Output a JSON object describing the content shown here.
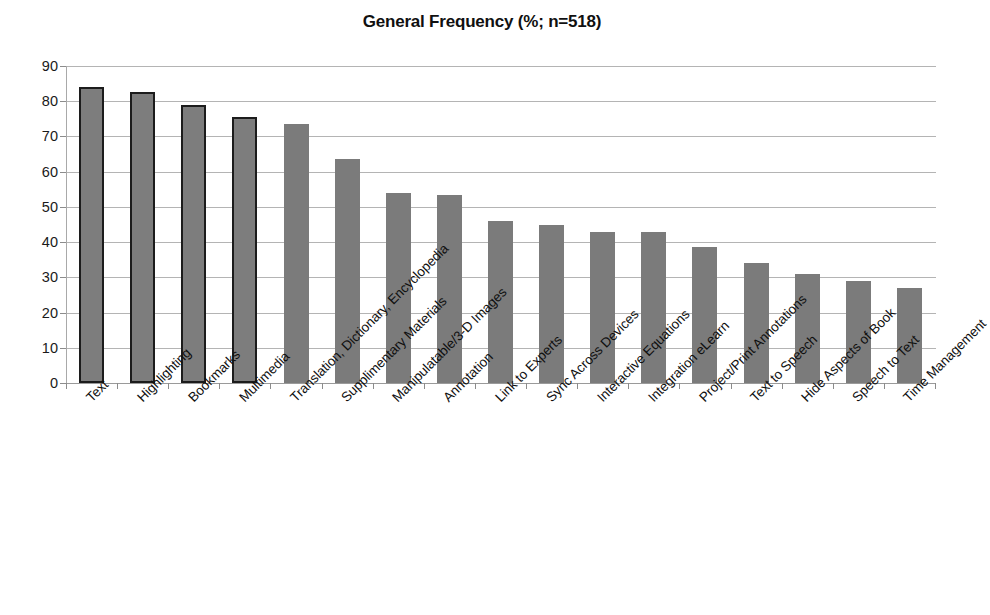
{
  "chart_data": {
    "type": "bar",
    "title": "General Frequency (%; n=518)",
    "xlabel": "",
    "ylabel": "",
    "ylim": [
      0,
      90
    ],
    "ytick_step": 10,
    "yticks": [
      "90",
      "80",
      "70",
      "60",
      "50",
      "40",
      "30",
      "20",
      "10",
      "0"
    ],
    "grid": true,
    "legend": false,
    "bar_color": "#7b7b7b",
    "bar_outline_color": "#1c1c1c",
    "categories": [
      "Text",
      "Highlighting",
      "Bookmarks",
      "Multimedia",
      "Translation, Dictionary, Encyclopedia",
      "Supplimentary Materials",
      "Manipulatable/3-D Images",
      "Annotation",
      "Link to Experts",
      "Sync Across Devices",
      "Interactive Equations",
      "Integration eLearn",
      "Project/Print Annotations",
      "Text to Speech",
      "Hide Aspects of Book",
      "Speech to Text",
      "Time Management"
    ],
    "values": [
      84,
      82.5,
      79,
      75.5,
      73.5,
      63.5,
      54,
      53.5,
      46,
      45,
      43,
      43,
      38.5,
      34,
      31,
      29,
      27
    ],
    "outlined_bars": [
      0,
      1,
      2,
      3
    ]
  }
}
